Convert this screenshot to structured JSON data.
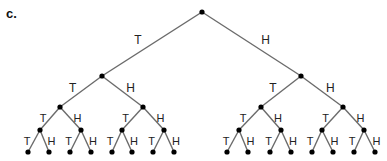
{
  "figure_label": "c.",
  "diagram": {
    "type": "probability-tree",
    "branch_labels": {
      "left": "T",
      "right": "H"
    },
    "edge_color": "#6b6b6b",
    "node_color": "#000000",
    "levels": [
      {
        "y": 12,
        "xs": [
          202
        ],
        "label_size": 12
      },
      {
        "y": 76,
        "xs": [
          102,
          301
        ],
        "label_size": 12
      },
      {
        "y": 107,
        "xs": [
          60,
          143,
          261,
          343
        ],
        "label_size": 11
      },
      {
        "y": 130,
        "xs": [
          40,
          81,
          122,
          164,
          239,
          281,
          322,
          364
        ],
        "label_size": 11
      },
      {
        "y": 152,
        "xs": [
          28,
          49,
          70,
          91,
          112,
          132,
          153,
          174,
          227,
          248,
          270,
          291,
          312,
          333,
          354,
          375
        ]
      }
    ]
  }
}
